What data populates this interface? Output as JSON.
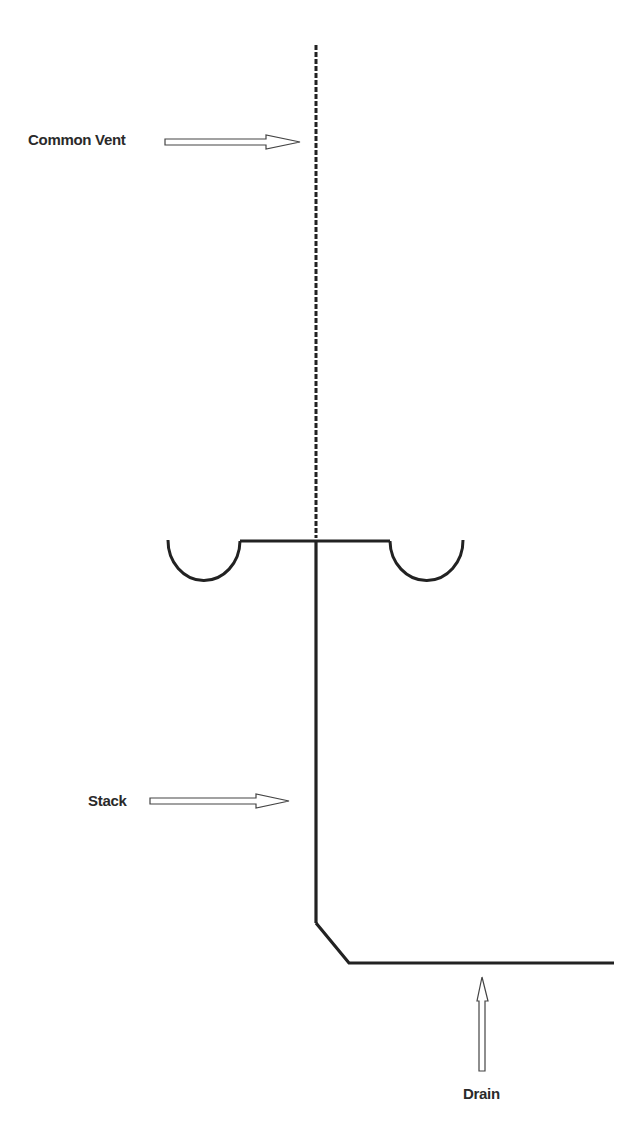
{
  "diagram": {
    "colors": {
      "line": "#222222",
      "background": "#ffffff",
      "text": "#2a2a2a"
    },
    "labels": {
      "common_vent": "Common Vent",
      "stack": "Stack",
      "drain": "Drain"
    },
    "components": [
      {
        "name": "common-vent",
        "style": "dashed",
        "from": [
          316,
          45
        ],
        "to": [
          316,
          540
        ]
      },
      {
        "name": "fixture-connection",
        "style": "solid",
        "from": [
          240,
          540
        ],
        "to": [
          390,
          540
        ]
      },
      {
        "name": "trap-left",
        "style": "solid",
        "type": "u-trap",
        "span": [
          168,
          240
        ],
        "top": 540
      },
      {
        "name": "trap-right",
        "style": "solid",
        "type": "u-trap",
        "span": [
          390,
          463
        ],
        "top": 540
      },
      {
        "name": "stack",
        "style": "solid",
        "from": [
          316,
          540
        ],
        "to": [
          316,
          923
        ]
      },
      {
        "name": "drain",
        "style": "solid",
        "path": [
          [
            316,
            923
          ],
          [
            349,
            963
          ],
          [
            614,
            963
          ]
        ]
      }
    ]
  }
}
